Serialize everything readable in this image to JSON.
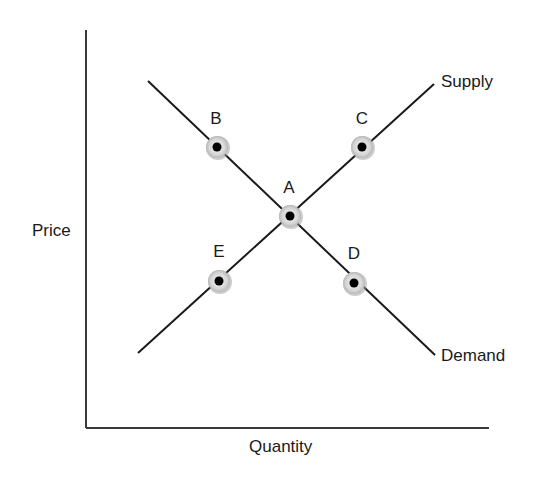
{
  "diagram": {
    "type": "supply-demand",
    "axes": {
      "x_label": "Quantity",
      "y_label": "Price"
    },
    "curves": [
      {
        "name": "Supply",
        "label": "Supply"
      },
      {
        "name": "Demand",
        "label": "Demand"
      }
    ],
    "points": [
      {
        "id": "A",
        "label": "A",
        "description": "equilibrium intersection"
      },
      {
        "id": "B",
        "label": "B",
        "on": "Demand"
      },
      {
        "id": "C",
        "label": "C",
        "on": "Supply"
      },
      {
        "id": "D",
        "label": "D",
        "on": "Demand"
      },
      {
        "id": "E",
        "label": "E",
        "on": "Supply"
      }
    ],
    "colors": {
      "line": "#1a1a1a",
      "axis": "#3a3a3a",
      "marker_ring": "#d4d4d4",
      "marker_center": "#000000"
    }
  }
}
